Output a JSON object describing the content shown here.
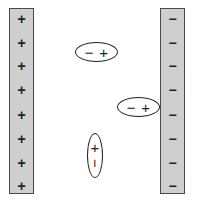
{
  "left_plate": {
    "charge": "positive",
    "signs": [
      "+",
      "+",
      "+",
      "+",
      "+",
      "+",
      "+",
      "+"
    ]
  },
  "right_plate": {
    "charge": "negative",
    "signs": [
      "−",
      "−",
      "−",
      "−",
      "−",
      "−",
      "−",
      "−"
    ]
  },
  "dipoles": [
    {
      "orientation": "horizontal",
      "first": "−",
      "second": "+"
    },
    {
      "orientation": "horizontal",
      "first": "−",
      "second": "+"
    },
    {
      "orientation": "vertical",
      "first": "+",
      "second": "−"
    }
  ],
  "colors": {
    "plate_fill": "#cfcfcf",
    "plate_border": "#4a4a4a",
    "ink": "#222222"
  }
}
